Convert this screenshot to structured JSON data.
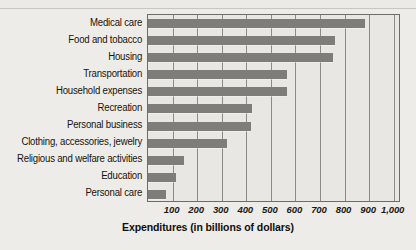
{
  "chart_data": {
    "type": "bar",
    "orientation": "horizontal",
    "title": "",
    "xlabel": "Expenditures (in billions of dollars)",
    "ylabel": "",
    "xlim": [
      0,
      1030
    ],
    "grid": true,
    "legend": false,
    "bar_color": "#7f7d79",
    "categories": [
      "Medical care",
      "Food and tobacco",
      "Housing",
      "Transportation",
      "Household expenses",
      "Recreation",
      "Personal business",
      "Clothing, accessories, jewelry",
      "Religious and welfare activities",
      "Education",
      "Personal care"
    ],
    "values": [
      885,
      760,
      755,
      565,
      565,
      425,
      420,
      320,
      145,
      115,
      75
    ],
    "xticks": [
      100,
      200,
      300,
      400,
      500,
      600,
      700,
      800,
      900,
      1000
    ],
    "xticklabels": [
      "100",
      "200",
      "300",
      "400",
      "500",
      "600",
      "700",
      "800",
      "900",
      "1,000"
    ]
  }
}
